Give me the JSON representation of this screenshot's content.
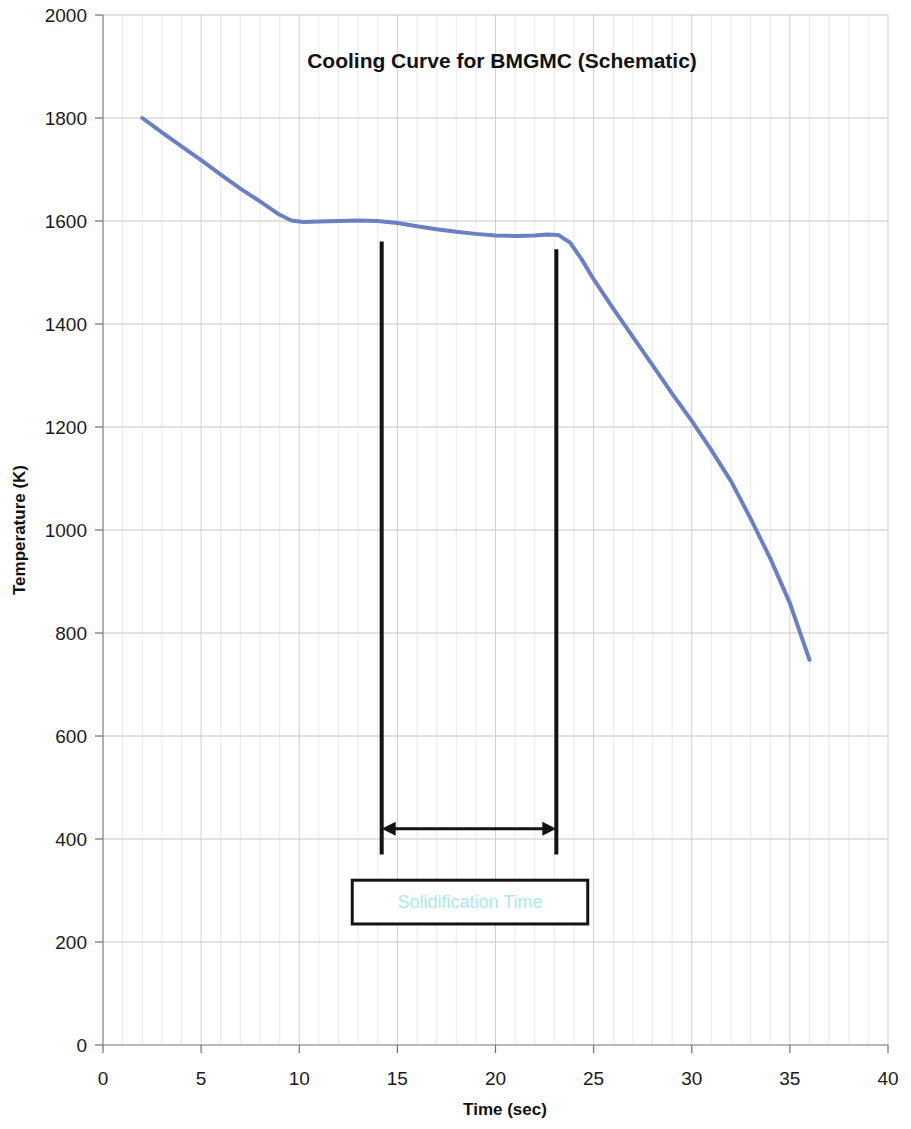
{
  "chart_data": {
    "type": "line",
    "title": "Cooling Curve for BMGMC (Schematic)",
    "xlabel": "Time (sec)",
    "ylabel": "Temperature (K)",
    "xlim": [
      0,
      40
    ],
    "ylim": [
      0,
      2000
    ],
    "xticks": [
      0,
      5,
      10,
      15,
      20,
      25,
      30,
      35,
      40
    ],
    "xtick_labels": [
      "0",
      "5",
      "10",
      "15",
      "20",
      "25",
      "30",
      "35",
      "40"
    ],
    "yticks": [
      0,
      200,
      400,
      600,
      800,
      1000,
      1200,
      1400,
      1600,
      1800,
      2000
    ],
    "ytick_labels": [
      "0",
      "200",
      "400",
      "600",
      "800",
      "1000",
      "1200",
      "1400",
      "1600",
      "1800",
      "2000"
    ],
    "grid": true,
    "grid_minor_x": true,
    "legend": false,
    "series": [
      {
        "name": "Cooling curve",
        "color": "#6b7fc4",
        "linewidth": 4,
        "x": [
          2.0,
          3.0,
          4.0,
          5.0,
          6.0,
          7.0,
          8.0,
          9.0,
          9.6,
          10.2,
          11.0,
          12.0,
          13.0,
          14.0,
          15.0,
          16.0,
          17.0,
          18.0,
          19.0,
          20.0,
          21.0,
          22.0,
          22.6,
          23.2,
          23.8,
          24.4,
          25.0,
          26.0,
          27.0,
          28.0,
          29.0,
          30.0,
          31.0,
          32.0,
          33.0,
          34.0,
          35.0,
          36.0
        ],
        "y": [
          1800,
          1772,
          1745,
          1718,
          1690,
          1663,
          1638,
          1612,
          1601,
          1598,
          1599,
          1600,
          1601,
          1600,
          1596,
          1590,
          1584,
          1579,
          1575,
          1572,
          1571,
          1572,
          1574,
          1573,
          1558,
          1525,
          1487,
          1430,
          1375,
          1320,
          1265,
          1212,
          1155,
          1095,
          1022,
          945,
          858,
          748
        ]
      }
    ],
    "annotations": {
      "marker_left": {
        "x": 14.2,
        "y_top": 1560,
        "y_bottom": 370
      },
      "marker_right": {
        "x": 23.1,
        "y_top": 1545,
        "y_bottom": 370
      },
      "span_arrow": {
        "x_start": 14.2,
        "x_end": 23.1,
        "y": 420,
        "label": "Solidification Time"
      },
      "callout": {
        "text": "Solidification Time",
        "text_color": "#a9e9ef",
        "border_color": "#131313",
        "fill": "#ffffff",
        "x_start": 12.7,
        "x_end": 24.7,
        "y_top": 320,
        "y_bottom": 235
      }
    }
  },
  "colors": {
    "series": "#6b7fc4",
    "annotation_text": "#a9e9ef",
    "axis": "#8d8d93",
    "grid": "#e3e3e6",
    "text": "#1a1a1a",
    "background": "#ffffff"
  }
}
